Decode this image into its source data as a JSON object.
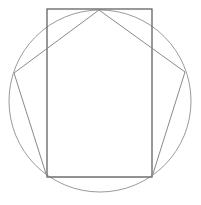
{
  "diagram": {
    "background": "#ffffff",
    "circle": {
      "cx": 100,
      "cy": 101,
      "r": 91,
      "stroke": "#9a9a9a",
      "stroke_width": 1
    },
    "rectangle": {
      "x": 47,
      "y": 9,
      "width": 105,
      "height": 168,
      "stroke": "#555555",
      "stroke_width": 1.2
    },
    "pentagon": {
      "points": "99,10 185,72 152,177 47,177 14,73",
      "stroke": "#8a8a8a",
      "stroke_width": 1
    }
  }
}
